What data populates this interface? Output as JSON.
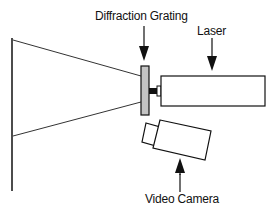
{
  "diagram": {
    "labels": {
      "grating": "Diffraction Grating",
      "laser": "Laser",
      "camera": "Video Camera"
    },
    "colors": {
      "stroke": "#111111",
      "grating_fill": "#c4c4c4",
      "background": "#ffffff"
    }
  }
}
